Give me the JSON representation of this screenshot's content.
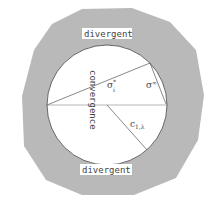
{
  "diagram": {
    "outer_region_label_top": "divergent",
    "outer_region_label_bottom": "divergent",
    "inner_region_label": "convergence",
    "symbols": {
      "sigma_star": {
        "base": "σ",
        "sup": "*",
        "sub": "i"
      },
      "sigma_inf": {
        "base": "σ",
        "sup": "∞"
      },
      "c_label": {
        "base": "c",
        "sub": "1,λ"
      }
    },
    "colors": {
      "outer_fill": "#b9b9b9",
      "inner_fill": "#ffffff",
      "stroke": "#555555",
      "label_bg": "#ffffff"
    }
  }
}
